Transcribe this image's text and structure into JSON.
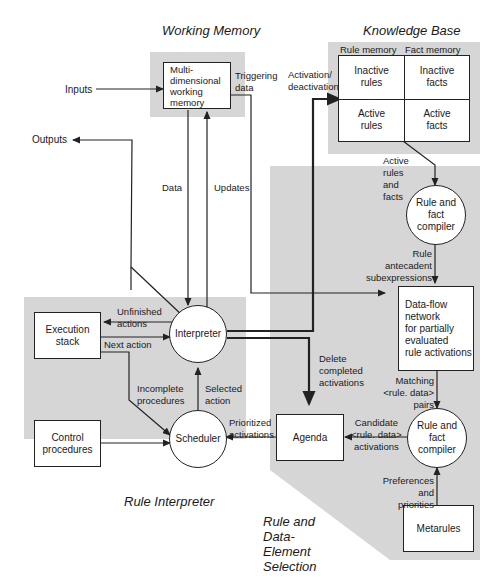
{
  "sections": {
    "working_memory": "Working  Memory",
    "knowledge_base": "Knowledge Base",
    "rule_interpreter": "Rule Interpreter",
    "rule_selection": "Rule and\nData-\nElement\nSelection"
  },
  "nodes": {
    "wm": "Multi-\ndimensional\nworking\nmemory",
    "kb_rule_memory": "Rule memory",
    "kb_fact_memory": "Fact memory",
    "inactive_rules": "Inactive\nrules",
    "inactive_facts": "Inactive\nfacts",
    "active_rules": "Active\nrules",
    "active_facts": "Active\nfacts",
    "compiler1": "Rule and\nfact\ncompiler",
    "dataflow": "Data-flow\nnetwork\nfor partially\nevaluated\nrule activations",
    "compiler2": "Rule and\nfact\ncompiler",
    "metarules": "Metarules",
    "agenda": "Agenda",
    "interpreter": "Interpreter",
    "scheduler": "Scheduler",
    "execution_stack": "Execution\nstack",
    "control_procedures": "Control\nprocedures"
  },
  "edges": {
    "inputs": "Inputs",
    "outputs": "Outputs",
    "triggering": "Triggering\ndata",
    "activation": "Activation/\ndeactivation",
    "data": "Data",
    "updates": "Updates",
    "active_rules_facts": "Active\nrules\nand\nfacts",
    "antecedent": "Rule\nantecadent\nsubexpressions",
    "unfinished": "Unfinished\nactions",
    "next_action": "Next action",
    "incomplete": "Incomplete\nprocedures",
    "selected": "Selected\naction",
    "delete": "Delete\ncompleted\nactivations",
    "matching": "Matching\n<rule. data>\npairs",
    "prioritized": "Prioritized\nactivations",
    "candidate": "Candidate\n<rule. data>\nactivations",
    "preferences": "Preferences\nand\npriorities"
  },
  "colors": {
    "shade": "#d6d6d6",
    "line": "#222222"
  }
}
